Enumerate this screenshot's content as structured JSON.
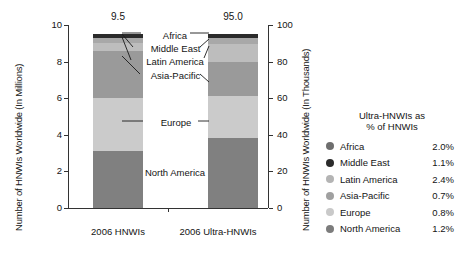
{
  "chart_data": {
    "type": "bar",
    "title": "",
    "subtitle": "",
    "stacked": true,
    "categories": [
      "2006 HNWIs",
      "2006 Ultra-HNWIs"
    ],
    "series": [
      {
        "name": "North America",
        "values": [
          3.1,
          38.0
        ],
        "color": "#808080"
      },
      {
        "name": "Europe",
        "values": [
          2.9,
          23.0
        ],
        "color": "#cbcbcb"
      },
      {
        "name": "Asia-Pacific",
        "values": [
          2.6,
          19.0
        ],
        "color": "#9a9a9a"
      },
      {
        "name": "Latin America",
        "values": [
          0.4,
          9.5
        ],
        "color": "#bdbdbd"
      },
      {
        "name": "Middle East",
        "values": [
          0.3,
          3.5
        ],
        "color": "#a8a8a8"
      },
      {
        "name": "Africa",
        "values": [
          0.2,
          2.0
        ],
        "color": "#2b2b2b"
      }
    ],
    "totals": [
      "9.5",
      "95.0"
    ],
    "ylabel": "Number of HNWIs Worldwide (In Millions)",
    "ylabel_right": "Number of HNWIs Worldwide (In Thousands)",
    "xlabel": "",
    "ylim": [
      0,
      10
    ],
    "ylim_right": [
      0,
      100
    ],
    "yticks": [
      "0",
      "2",
      "4",
      "6",
      "8",
      "10"
    ],
    "yticks_right": [
      "0",
      "20",
      "40",
      "60",
      "80",
      "100"
    ],
    "grid": false,
    "legend_position": "right"
  },
  "axes": {
    "left_title": "Number of HNWIs Worldwide (In Millions)",
    "right_title": "Number of HNWIs Worldwide (In Thousands)",
    "left_ticks": [
      "10",
      "8",
      "6",
      "4",
      "2",
      "0"
    ],
    "right_ticks": [
      "100",
      "80",
      "60",
      "40",
      "20",
      "0"
    ]
  },
  "bars": {
    "hnwi": {
      "label": "2006 HNWIs",
      "total": "9.5"
    },
    "ultra": {
      "label": "2006 Ultra-HNWIs",
      "total": "95.0"
    }
  },
  "callouts": {
    "africa": "Africa",
    "middle_east": "Middle East",
    "latin_america": "Latin America",
    "asia_pacific": "Asia-Pacific",
    "europe": "Europe",
    "north_america": "North America"
  },
  "legend": {
    "title_line1": "Ultra-HNWIs as",
    "title_line2": "% of HNWIs",
    "items": [
      {
        "label": "Africa",
        "value": "2.0%",
        "color": "#6e6e6e"
      },
      {
        "label": "Middle East",
        "value": "1.1%",
        "color": "#2b2b2b"
      },
      {
        "label": "Latin America",
        "value": "2.4%",
        "color": "#b4b4b4"
      },
      {
        "label": "Asia-Pacific",
        "value": "0.7%",
        "color": "#a0a0a0"
      },
      {
        "label": "Europe",
        "value": "0.8%",
        "color": "#c9c9c9"
      },
      {
        "label": "North America",
        "value": "1.2%",
        "color": "#7c7c7c"
      }
    ]
  }
}
